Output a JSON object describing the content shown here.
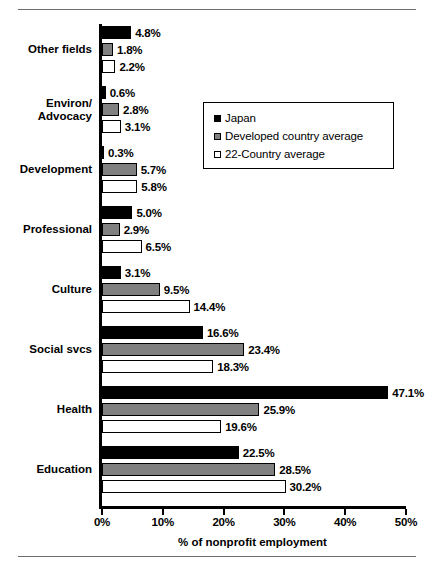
{
  "chart_data": {
    "type": "bar",
    "orientation": "horizontal",
    "title": "",
    "xlabel": "% of nonprofit employment",
    "ylabel": "",
    "xlim": [
      0,
      50
    ],
    "xticks": [
      "0%",
      "10%",
      "20%",
      "30%",
      "40%",
      "50%"
    ],
    "xtick_values": [
      0,
      10,
      20,
      30,
      40,
      50
    ],
    "grid": false,
    "legend_position": "upper-right-inside",
    "categories": [
      "Other fields",
      "Environ/\nAdvocacy",
      "Development",
      "Professional",
      "Culture",
      "Social svcs",
      "Health",
      "Education"
    ],
    "series": [
      {
        "name": "Japan",
        "color": "#000000",
        "values": [
          4.8,
          0.6,
          0.3,
          5.0,
          3.1,
          16.6,
          47.1,
          22.5
        ],
        "labels": [
          "4.8%",
          "0.6%",
          "0.3%",
          "5.0%",
          "3.1%",
          "16.6%",
          "47.1%",
          "22.5%"
        ]
      },
      {
        "name": "Developed country average",
        "color": "#808080",
        "values": [
          1.8,
          2.8,
          5.7,
          2.9,
          9.5,
          23.4,
          25.9,
          28.5
        ],
        "labels": [
          "1.8%",
          "2.8%",
          "5.7%",
          "2.9%",
          "9.5%",
          "23.4%",
          "25.9%",
          "28.5%"
        ]
      },
      {
        "name": "22-Country average",
        "color": "#ffffff",
        "values": [
          2.2,
          3.1,
          5.8,
          6.5,
          14.4,
          18.3,
          19.6,
          30.2
        ],
        "labels": [
          "2.2%",
          "3.1%",
          "5.8%",
          "6.5%",
          "14.4%",
          "18.3%",
          "19.6%",
          "30.2%"
        ]
      }
    ]
  },
  "legend": {
    "items": [
      {
        "label": "Japan",
        "swatch": "black-square-icon"
      },
      {
        "label": "Developed country average",
        "swatch": "gray-square-icon"
      },
      {
        "label": "22-Country average",
        "swatch": "white-square-icon"
      }
    ]
  },
  "category_labels": [
    {
      "lines": [
        "Other fields"
      ]
    },
    {
      "lines": [
        "Environ/",
        "Advocacy"
      ]
    },
    {
      "lines": [
        "Development"
      ]
    },
    {
      "lines": [
        "Professional"
      ]
    },
    {
      "lines": [
        "Culture"
      ]
    },
    {
      "lines": [
        "Social svcs"
      ]
    },
    {
      "lines": [
        "Health"
      ]
    },
    {
      "lines": [
        "Education"
      ]
    }
  ]
}
